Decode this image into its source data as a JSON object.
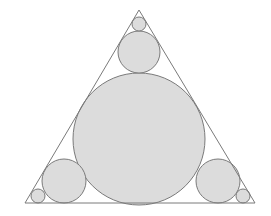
{
  "diagram": {
    "title": "",
    "colors": {
      "background": "#ffffff",
      "stroke": "#7a7a7a",
      "fill": "#dcdcdc"
    },
    "triangle": {
      "points": [
        [
          139,
          10
        ],
        [
          25,
          203
        ],
        [
          255,
          203
        ]
      ]
    },
    "circles": [
      {
        "id": "incircle",
        "cx": 139,
        "cy": 139,
        "r": 66
      },
      {
        "id": "top-medium",
        "cx": 139,
        "cy": 52,
        "r": 21
      },
      {
        "id": "top-small",
        "cx": 139,
        "cy": 24,
        "r": 7
      },
      {
        "id": "left-medium",
        "cx": 64,
        "cy": 181,
        "r": 22
      },
      {
        "id": "left-small",
        "cx": 38,
        "cy": 196,
        "r": 7
      },
      {
        "id": "right-medium",
        "cx": 218,
        "cy": 181,
        "r": 22
      },
      {
        "id": "right-small",
        "cx": 243,
        "cy": 196,
        "r": 7
      }
    ]
  }
}
